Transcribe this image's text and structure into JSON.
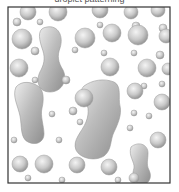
{
  "title": "droplet patterning",
  "frame": {
    "x": 8,
    "y": 7,
    "w": 162,
    "h": 176,
    "stroke": "#333333"
  },
  "colors": {
    "background": "#ffffff",
    "blob_light": "#f2f2f2",
    "blob_mid": "#c8c8c8",
    "blob_dark": "#8f8f8f"
  },
  "drops": [
    [
      28,
      12,
      8
    ],
    [
      58,
      12,
      9
    ],
    [
      100,
      10,
      8
    ],
    [
      131,
      12,
      7
    ],
    [
      158,
      10,
      7
    ],
    [
      17,
      22,
      4
    ],
    [
      40,
      22,
      3
    ],
    [
      100,
      25,
      3
    ],
    [
      136,
      26,
      4
    ],
    [
      163,
      28,
      4
    ],
    [
      22,
      39,
      10
    ],
    [
      112,
      33,
      9
    ],
    [
      85,
      38,
      10
    ],
    [
      138,
      35,
      10
    ],
    [
      166,
      36,
      7
    ],
    [
      35,
      51,
      4
    ],
    [
      75,
      50,
      3
    ],
    [
      104,
      53,
      3
    ],
    [
      134,
      53,
      3
    ],
    [
      160,
      55,
      4
    ],
    [
      19,
      68,
      9
    ],
    [
      110,
      67,
      9
    ],
    [
      147,
      68,
      9
    ],
    [
      168,
      69,
      6
    ],
    [
      35,
      80,
      3
    ],
    [
      66,
      80,
      4
    ],
    [
      144,
      86,
      3
    ],
    [
      162,
      84,
      3
    ],
    [
      84,
      98,
      9
    ],
    [
      135,
      91,
      8
    ],
    [
      162,
      102,
      8
    ],
    [
      73,
      111,
      4
    ],
    [
      52,
      114,
      3
    ],
    [
      80,
      122,
      3
    ],
    [
      134,
      113,
      3
    ],
    [
      149,
      116,
      3
    ],
    [
      14,
      140,
      3
    ],
    [
      59,
      140,
      3
    ],
    [
      130,
      128,
      3
    ],
    [
      20,
      164,
      8
    ],
    [
      44,
      164,
      9
    ],
    [
      77,
      165,
      8
    ],
    [
      109,
      167,
      8
    ],
    [
      158,
      140,
      8
    ],
    [
      28,
      178,
      3
    ],
    [
      62,
      180,
      3
    ],
    [
      118,
      180,
      3
    ],
    [
      134,
      178,
      5
    ]
  ],
  "blobs": [
    {
      "name": "dumbbell-left",
      "d": "M47 27 C58 25 64 36 60 48 C57 56 58 62 63 70 C68 80 62 92 50 92 C38 92 35 80 41 70 C45 62 45 56 42 48 C38 36 38 28 47 27 Z"
    },
    {
      "name": "left-large",
      "d": "M16 87 C22 80 32 82 38 86 C44 90 44 100 42 108 C40 116 44 126 44 134 C44 142 36 146 28 142 C20 138 22 126 20 116 C18 106 12 96 16 87 Z"
    },
    {
      "name": "center-large",
      "d": "M84 86 C92 80 104 78 114 82 C122 86 118 98 120 106 C122 114 118 124 114 132 C110 140 112 150 104 156 C94 162 80 158 76 150 C72 140 82 132 86 122 C90 112 88 104 84 98 C82 92 80 90 84 86 Z"
    },
    {
      "name": "dumbbell-right",
      "d": "M131 147 C138 141 148 144 148 153 C148 160 146 164 149 170 C153 178 148 186 140 184 C132 182 132 175 134 168 C135 162 128 156 131 147 Z"
    }
  ]
}
